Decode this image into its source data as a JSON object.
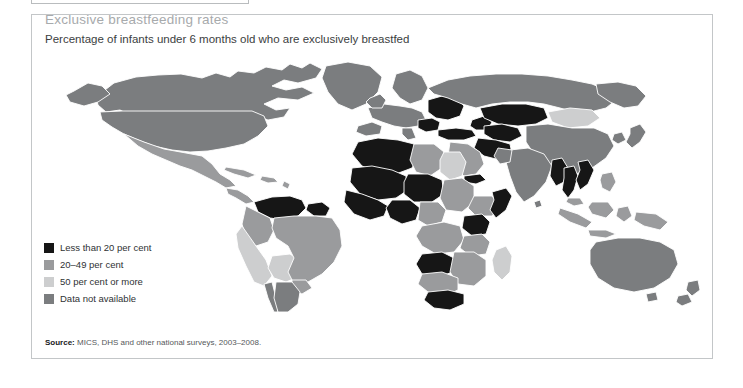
{
  "figure": {
    "title": "Exclusive breastfeeding rates",
    "subtitle": "Percentage of infants under 6 months old who are exclusively breastfed",
    "source_label": "Source:",
    "source_text": " MICS, DHS and other national surveys, 2003–2008."
  },
  "legend": {
    "items": [
      {
        "label": "Less than 20 per cent",
        "color": "#161616"
      },
      {
        "label": "20–49 per cent",
        "color": "#9a9b9d"
      },
      {
        "label": "50 per cent or more",
        "color": "#cdcecf"
      },
      {
        "label": "Data not available",
        "color": "#7b7d7f"
      }
    ]
  },
  "map": {
    "projection": "world-choropleth",
    "background": "#ffffff",
    "border_color": "#ffffff",
    "colors": {
      "under20": "#161616",
      "mid20to49": "#9a9b9d",
      "over50": "#cdcecf",
      "nodata": "#7b7d7f"
    },
    "regions": [
      {
        "name": "Canada",
        "category": "nodata"
      },
      {
        "name": "United States",
        "category": "nodata"
      },
      {
        "name": "Greenland",
        "category": "nodata"
      },
      {
        "name": "Mexico",
        "category": "mid20to49"
      },
      {
        "name": "Central America",
        "category": "mid20to49"
      },
      {
        "name": "Caribbean",
        "category": "mid20to49"
      },
      {
        "name": "Venezuela",
        "category": "under20"
      },
      {
        "name": "Suriname",
        "category": "under20"
      },
      {
        "name": "Colombia",
        "category": "mid20to49"
      },
      {
        "name": "Peru",
        "category": "over50"
      },
      {
        "name": "Bolivia",
        "category": "over50"
      },
      {
        "name": "Brazil",
        "category": "mid20to49"
      },
      {
        "name": "Chile",
        "category": "nodata"
      },
      {
        "name": "Argentina",
        "category": "nodata"
      },
      {
        "name": "Western Europe",
        "category": "nodata"
      },
      {
        "name": "Eastern Europe",
        "category": "under20"
      },
      {
        "name": "Russian Federation",
        "category": "nodata"
      },
      {
        "name": "Kazakhstan",
        "category": "under20"
      },
      {
        "name": "Central Asia",
        "category": "under20"
      },
      {
        "name": "Mongolia",
        "category": "over50"
      },
      {
        "name": "China",
        "category": "nodata"
      },
      {
        "name": "India",
        "category": "nodata"
      },
      {
        "name": "Turkey",
        "category": "under20"
      },
      {
        "name": "Middle East",
        "category": "mid20to49"
      },
      {
        "name": "Algeria",
        "category": "under20"
      },
      {
        "name": "Libya",
        "category": "mid20to49"
      },
      {
        "name": "Egypt",
        "category": "over50"
      },
      {
        "name": "Sahel",
        "category": "under20"
      },
      {
        "name": "Nigeria",
        "category": "under20"
      },
      {
        "name": "Ethiopia",
        "category": "mid20to49"
      },
      {
        "name": "Somalia",
        "category": "under20"
      },
      {
        "name": "Kenya",
        "category": "under20"
      },
      {
        "name": "Angola",
        "category": "under20"
      },
      {
        "name": "Southern Africa",
        "category": "mid20to49"
      },
      {
        "name": "South Africa",
        "category": "under20"
      },
      {
        "name": "Madagascar",
        "category": "over50"
      },
      {
        "name": "Myanmar",
        "category": "under20"
      },
      {
        "name": "Thailand",
        "category": "under20"
      },
      {
        "name": "Viet Nam",
        "category": "under20"
      },
      {
        "name": "Indonesia",
        "category": "mid20to49"
      },
      {
        "name": "Philippines",
        "category": "mid20to49"
      },
      {
        "name": "Papua New Guinea",
        "category": "mid20to49"
      },
      {
        "name": "Australia",
        "category": "nodata"
      },
      {
        "name": "New Zealand",
        "category": "nodata"
      }
    ]
  }
}
